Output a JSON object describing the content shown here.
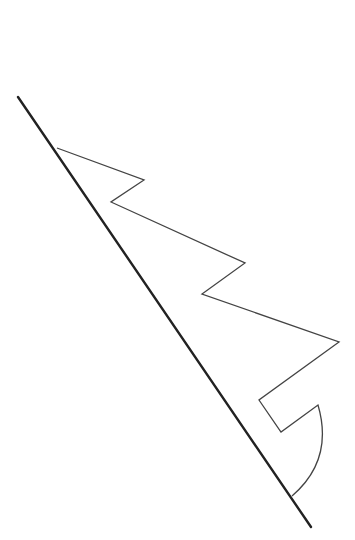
{
  "canvas": {
    "width": 355,
    "height": 540,
    "background": "#ffffff"
  },
  "colors": {
    "axis_line": "#222222",
    "shape_stroke": "#444444"
  },
  "diagram": {
    "fold_line": {
      "x1": 18,
      "y1": 97,
      "x2": 311,
      "y2": 527
    },
    "cut_path": "M57,148 L144,180 L111,202 L245,263 L202,294 L339,342 L259,400 L281,432 L318,405 Q334,460 292,496"
  }
}
